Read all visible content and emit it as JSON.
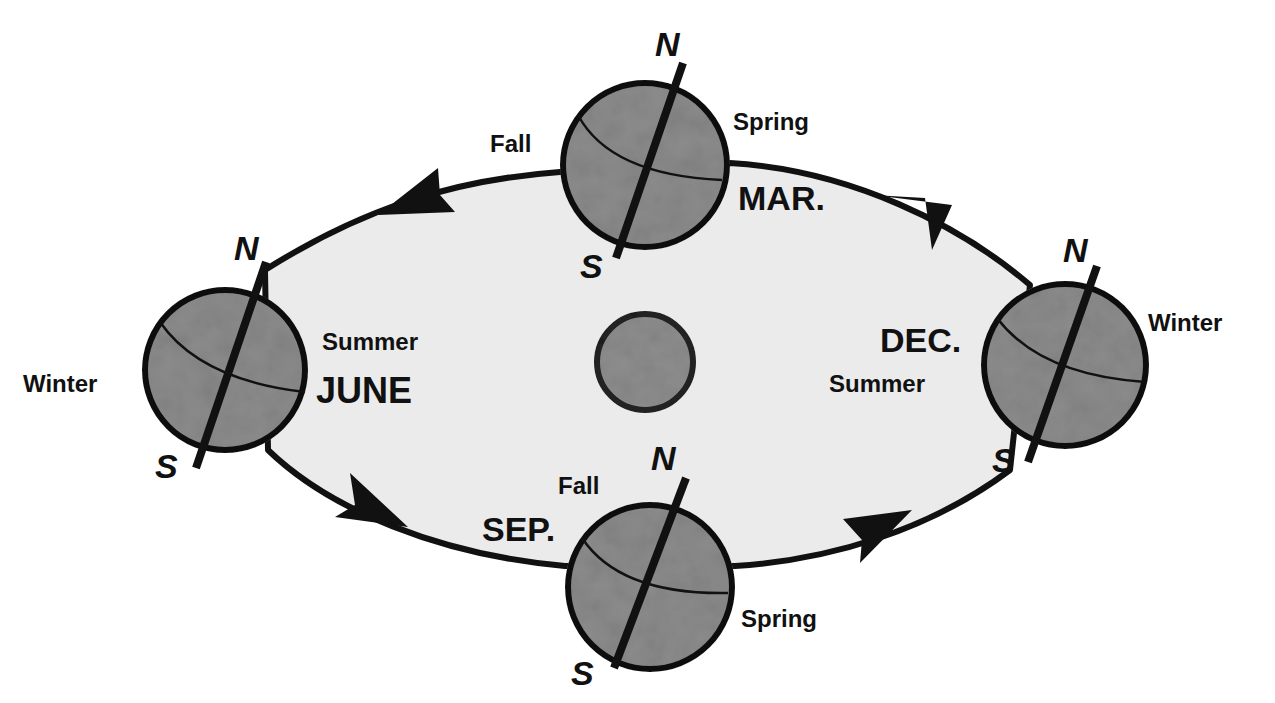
{
  "diagram": {
    "colors": {
      "background": "#ffffff",
      "orbit_fill": "#ebebeb",
      "globe_fill": "#8c8c8c",
      "sun_fill": "#8e8e8e",
      "stroke": "#111111"
    },
    "sun": {
      "label": ""
    },
    "positions": [
      {
        "id": "june",
        "month": "JUNE",
        "north_season": "Summer",
        "south_season": "Winter",
        "north_pole": "N",
        "south_pole": "S"
      },
      {
        "id": "march",
        "month": "MAR.",
        "north_season": "Spring",
        "south_season": "Fall",
        "north_pole": "N",
        "south_pole": "S"
      },
      {
        "id": "december",
        "month": "DEC.",
        "north_season": "Winter",
        "south_season": "Summer",
        "north_pole": "N",
        "south_pole": "S"
      },
      {
        "id": "september",
        "month": "SEP.",
        "north_season": "Fall",
        "south_season": "Spring",
        "north_pole": "N",
        "south_pole": "S"
      }
    ],
    "orbit_direction": "counter-clockwise (as viewed)",
    "arrows": [
      "top-left pointing left",
      "top-right pointing up-left",
      "bottom-left pointing right",
      "bottom-right pointing right"
    ]
  }
}
